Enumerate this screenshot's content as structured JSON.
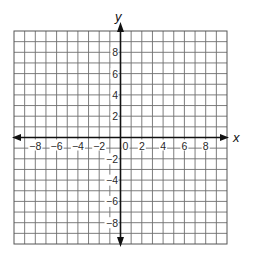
{
  "diagram": {
    "type": "coordinate-plane",
    "axes": {
      "x_label": "x",
      "y_label": "y",
      "x_range": [
        -10,
        10
      ],
      "y_range": [
        -10,
        10
      ],
      "grid_step": 1,
      "label_step": 2
    },
    "x_tick_labels": [
      {
        "value": -8,
        "text": "−8"
      },
      {
        "value": -6,
        "text": "−6"
      },
      {
        "value": -4,
        "text": "−4"
      },
      {
        "value": -2,
        "text": "−2"
      },
      {
        "value": 0,
        "text": "0"
      },
      {
        "value": 2,
        "text": "2"
      },
      {
        "value": 4,
        "text": "4"
      },
      {
        "value": 6,
        "text": "6"
      },
      {
        "value": 8,
        "text": "8"
      }
    ],
    "y_tick_labels": [
      {
        "value": 8,
        "text": "8"
      },
      {
        "value": 6,
        "text": "6"
      },
      {
        "value": 4,
        "text": "4"
      },
      {
        "value": 2,
        "text": "2"
      },
      {
        "value": -2,
        "text": "−2"
      },
      {
        "value": -4,
        "text": "−4"
      },
      {
        "value": -6,
        "text": "−6"
      },
      {
        "value": -8,
        "text": "−8"
      }
    ],
    "colors": {
      "grid": "#6e6e6e",
      "axis": "#111111",
      "background": "#ffffff"
    }
  }
}
